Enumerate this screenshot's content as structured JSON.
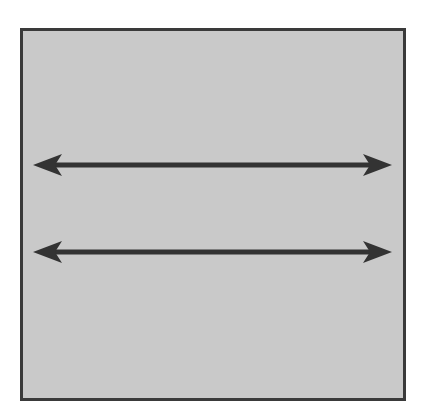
{
  "diagram": {
    "panel": {
      "fill": "#c9c9c9",
      "border": "#3a3a3a"
    },
    "arrows": [
      {
        "id": "arrow-top",
        "type": "double-headed",
        "x1": 33,
        "x2": 392,
        "y": 165,
        "color": "#333333"
      },
      {
        "id": "arrow-bottom",
        "type": "double-headed",
        "x1": 33,
        "x2": 392,
        "y": 252,
        "color": "#333333"
      }
    ]
  }
}
